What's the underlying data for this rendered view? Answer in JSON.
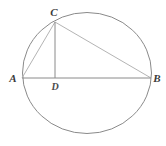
{
  "figure": {
    "canvas": {
      "width": 166,
      "height": 146,
      "background": "#ffffff"
    }
  },
  "colors": {
    "circle_stroke": "#8a8a8a",
    "chord_stroke": "#b0b0b0",
    "diameter_stroke": "#8a8a8a",
    "altitude_stroke": "#8a8a8a",
    "label_color": "#3a3a3a",
    "background": "#ffffff"
  },
  "circle": {
    "name": "circle",
    "cx": 87,
    "cy": 73,
    "rx": 65,
    "ry": 61,
    "stroke_width": 1
  },
  "points": [
    {
      "id": "A",
      "label": "A",
      "x": 22,
      "y": 78,
      "label_x": 13,
      "label_y": 81
    },
    {
      "id": "B",
      "label": "B",
      "x": 151,
      "y": 78,
      "label_x": 156,
      "label_y": 81
    },
    {
      "id": "C",
      "label": "C",
      "x": 55,
      "y": 22,
      "label_x": 54,
      "label_y": 16
    },
    {
      "id": "D",
      "label": "D",
      "x": 55,
      "y": 78,
      "label_x": 54,
      "label_y": 89
    }
  ],
  "segments": [
    {
      "id": "AB",
      "name": "segment-ab-diameter",
      "from": "A",
      "to": "B",
      "x1": 22,
      "y1": 78,
      "x2": 151,
      "y2": 78,
      "stroke": "#8a8a8a",
      "width": 1
    },
    {
      "id": "AC",
      "name": "segment-ac-chord",
      "from": "A",
      "to": "C",
      "x1": 22,
      "y1": 78,
      "x2": 55,
      "y2": 22,
      "stroke": "#b4b4b4",
      "width": 1
    },
    {
      "id": "CB",
      "name": "segment-cb-chord",
      "from": "C",
      "to": "B",
      "x1": 55,
      "y1": 22,
      "x2": 151,
      "y2": 78,
      "stroke": "#b4b4b4",
      "width": 1
    },
    {
      "id": "CD",
      "name": "segment-cd-altitude",
      "from": "C",
      "to": "D",
      "x1": 55,
      "y1": 22,
      "x2": 55,
      "y2": 78,
      "stroke": "#8a8a8a",
      "width": 1
    }
  ],
  "labels": {
    "A": "A",
    "B": "B",
    "C": "C",
    "D": "D"
  }
}
